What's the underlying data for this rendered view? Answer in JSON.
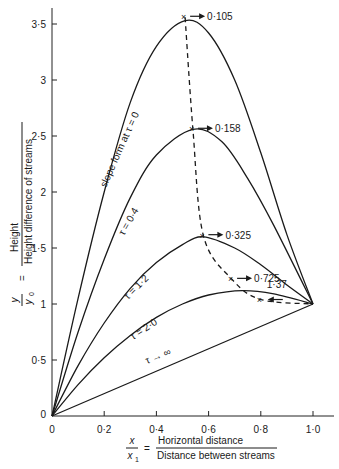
{
  "chart_data": {
    "type": "line",
    "title": "",
    "xlabel": {
      "lhs_num": "x",
      "lhs_den": "x",
      "lhs_den_sub": "1",
      "eq": "=",
      "num": "Horizontal distance",
      "den": "Distance between streams"
    },
    "ylabel": {
      "lhs_num": "y",
      "lhs_den": "y",
      "lhs_den_sub": "0",
      "eq": "=",
      "num": "Height",
      "den": "Height difference of streams"
    },
    "xlim": [
      0,
      1.0
    ],
    "ylim": [
      0,
      3.6
    ],
    "x_ticks": [
      {
        "value": 0,
        "label": "0"
      },
      {
        "value": 0.2,
        "label": "0·2"
      },
      {
        "value": 0.4,
        "label": "0·4"
      },
      {
        "value": 0.6,
        "label": "0·6"
      },
      {
        "value": 0.8,
        "label": "0·8"
      },
      {
        "value": 1.0,
        "label": "1·0"
      }
    ],
    "y_ticks": [
      {
        "value": 0,
        "label": "0"
      },
      {
        "value": 0.5,
        "label": "0·5"
      },
      {
        "value": 1,
        "label": "1"
      },
      {
        "value": 1.5,
        "label": "1·5"
      },
      {
        "value": 2,
        "label": "2"
      },
      {
        "value": 2.5,
        "label": "2·5"
      },
      {
        "value": 3,
        "label": "3"
      },
      {
        "value": 3.5,
        "label": "3·5"
      }
    ],
    "grid": false,
    "legend": "none (curves labelled inline)",
    "series": [
      {
        "name": "slope form at τ = 0",
        "label": "slope form at τ = 0",
        "x": [
          0,
          0.1,
          0.2,
          0.3,
          0.4,
          0.51,
          0.6,
          0.7,
          0.8,
          0.9,
          1.0
        ],
        "y": [
          0,
          1.05,
          2.0,
          2.8,
          3.3,
          3.53,
          3.42,
          3.0,
          2.35,
          1.62,
          1.0
        ]
      },
      {
        "name": "τ = 0·4",
        "label": "τ = 0·4",
        "x": [
          0,
          0.1,
          0.2,
          0.3,
          0.4,
          0.54,
          0.65,
          0.75,
          0.85,
          1.0
        ],
        "y": [
          0,
          0.75,
          1.4,
          1.95,
          2.33,
          2.56,
          2.45,
          2.12,
          1.7,
          1.0
        ]
      },
      {
        "name": "τ = 1·2",
        "label": "τ = 1·2",
        "x": [
          0,
          0.1,
          0.2,
          0.3,
          0.4,
          0.5,
          0.58,
          0.7,
          0.8,
          0.9,
          1.0
        ],
        "y": [
          0,
          0.45,
          0.83,
          1.14,
          1.37,
          1.53,
          1.6,
          1.5,
          1.35,
          1.17,
          1.0
        ]
      },
      {
        "name": "τ = 2·0",
        "label": "τ = 2·0",
        "x": [
          0,
          0.1,
          0.2,
          0.3,
          0.4,
          0.5,
          0.6,
          0.73,
          0.85,
          1.0
        ],
        "y": [
          0,
          0.28,
          0.52,
          0.72,
          0.88,
          1.0,
          1.08,
          1.12,
          1.09,
          1.0
        ]
      },
      {
        "name": "τ → ∞",
        "label": "τ → ∞",
        "x": [
          0,
          1.0
        ],
        "y": [
          0,
          1.0
        ]
      }
    ],
    "locus": {
      "name": "locus of crest (dashed)",
      "style": "dashed",
      "points": [
        {
          "x": 0.51,
          "y": 3.56,
          "label": "0·105"
        },
        {
          "x": 0.54,
          "y": 2.56,
          "label": "0·158"
        },
        {
          "x": 0.58,
          "y": 1.61,
          "label": "0·325"
        },
        {
          "x": 0.69,
          "y": 1.22,
          "label": "0·725"
        },
        {
          "x": 0.8,
          "y": 1.04,
          "label": "1·37"
        },
        {
          "x": 1.0,
          "y": 1.0,
          "label": ""
        }
      ]
    }
  }
}
